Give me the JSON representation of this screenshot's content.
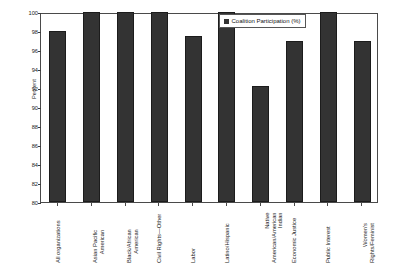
{
  "chart_data": {
    "type": "bar",
    "title": "",
    "subtitle": "",
    "xlabel": "",
    "ylabel": "Percent",
    "ylim": [
      80,
      100
    ],
    "ytick_step": 2,
    "yticks": [
      100,
      98,
      96,
      94,
      92,
      90,
      88,
      86,
      84,
      82,
      80
    ],
    "grid": false,
    "legend_position": "top-right",
    "legend": [
      "Coalition Participation (%)"
    ],
    "categories": [
      "All organizations",
      "Asian Pacific American",
      "Black/African American",
      "Civil Rights—Other",
      "Labor",
      "Latino/Hispanic",
      "Native American/American Indian",
      "Economic Justice",
      "Public Interest",
      "Women's Rights/Feminist"
    ],
    "category_lines": [
      [
        "All organizations"
      ],
      [
        "Asian Pacific",
        "American"
      ],
      [
        "Black/African",
        "American"
      ],
      [
        "Civil Rights—Other"
      ],
      [
        "Labor"
      ],
      [
        "Latino/Hispanic"
      ],
      [
        "Native",
        "American/American",
        "Indian"
      ],
      [
        "Economic Justice"
      ],
      [
        "Public Interest"
      ],
      [
        "Women's",
        "Rights/Feminist"
      ]
    ],
    "series": [
      {
        "name": "Coalition Participation (%)",
        "color": "#333333",
        "values": [
          98.0,
          100.0,
          100.0,
          100.0,
          97.5,
          100.0,
          92.2,
          97.0,
          100.0,
          97.0
        ]
      }
    ]
  },
  "colors": {
    "bar": "#333333",
    "bar_border": "#1c1c1c",
    "axis": "#4a4a4a",
    "text": "#1a1a1a",
    "background": "#ffffff"
  }
}
